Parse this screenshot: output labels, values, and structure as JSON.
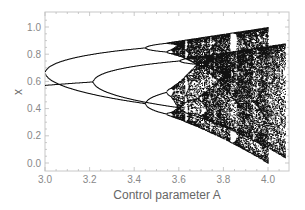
{
  "chart_data": {
    "type": "scatter",
    "title": "",
    "xlabel": "Control parameter A",
    "ylabel": "x",
    "xlim": [
      3.0,
      4.09
    ],
    "ylim": [
      -0.06,
      1.11
    ],
    "x_ticks": [
      "3.0",
      "3.2",
      "3.4",
      "3.6",
      "3.8",
      "4.0"
    ],
    "y_ticks": [
      "0.0",
      "0.2",
      "0.4",
      "0.6",
      "0.8",
      "1.0"
    ],
    "grid": false,
    "legend": null,
    "series": [
      {
        "name": "branch 1 (logistic map attractor)",
        "description": "single fixed point ~0.667 at A=3.0, period-doubling at ~3.45 and ~3.54, chaos from ~3.57 to 4.0, window near A~3.83",
        "points_summary": [
          {
            "A": 3.0,
            "x": [
              0.667
            ]
          },
          {
            "A": 3.2,
            "x": [
              0.513,
              0.799
            ]
          },
          {
            "A": 3.4,
            "x": [
              0.452,
              0.842
            ]
          },
          {
            "A": 3.5,
            "x": [
              0.383,
              0.501,
              0.827,
              0.875
            ]
          },
          {
            "A": 3.83,
            "x": [
              0.156,
              0.505,
              0.957
            ]
          },
          {
            "A": 4.0,
            "x_range": [
              0.0,
              1.0
            ]
          }
        ]
      },
      {
        "name": "branch 2 (second attractor)",
        "description": "starts ~0.51 at A=3.0, splits near A~3.27, continues into chaotic band extending to A~4.08",
        "points_summary": [
          {
            "A": 3.0,
            "x": [
              0.51
            ]
          },
          {
            "A": 3.25,
            "x": [
              0.55
            ]
          },
          {
            "A": 3.4,
            "x": [
              0.45,
              0.68
            ]
          },
          {
            "A": 3.55,
            "x": [
              0.4,
              0.75
            ]
          },
          {
            "A": 4.07,
            "x_range": [
              0.05,
              0.88
            ]
          }
        ]
      }
    ],
    "colors": {
      "points": "#111111",
      "frame": "#bbbbbb",
      "tick_text": "#888888",
      "axis_title": "#666666"
    }
  }
}
